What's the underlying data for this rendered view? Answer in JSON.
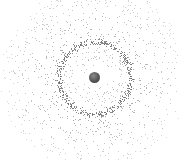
{
  "canvas": {
    "width": 179,
    "height": 161,
    "background": "#ffffff"
  },
  "center": {
    "x": 94.5,
    "y": 77.5
  },
  "sphere": {
    "radius": 5.5,
    "color": "#555555"
  },
  "ring": {
    "radius": 36,
    "thickness": 5,
    "dot_count": 520,
    "dot_color": "#6a6a6a"
  },
  "inner_field": {
    "dot_count": 180,
    "min_radius": 9,
    "max_radius": 33,
    "dot_color": "#9a9a9a"
  },
  "outer_field": {
    "dot_count": 900,
    "min_radius": 39,
    "max_radius": 95,
    "dot_color": "#9c9c9c"
  },
  "dot_size": 0.9,
  "seed": 7
}
